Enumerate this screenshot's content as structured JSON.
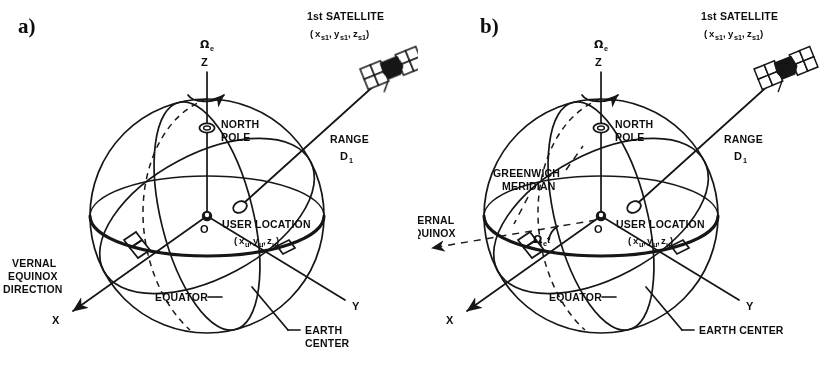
{
  "figure": {
    "domain": "diagram",
    "background_color": "#ffffff",
    "ink_color": "#141414",
    "width": 836,
    "height": 381
  },
  "panels": [
    {
      "id": "a",
      "tag": "a)",
      "satellite": {
        "title": "1st SATELLITE",
        "coords_open": "(",
        "coords": [
          {
            "base": "x",
            "sub": "s1"
          },
          {
            "base": "y",
            "sub": "s1"
          },
          {
            "base": "z",
            "sub": "s1"
          }
        ],
        "coords_close": ")",
        "icon": "satellite-icon"
      },
      "range": {
        "line1": "RANGE",
        "base": "D",
        "sub": "1"
      },
      "spin_axis": {
        "omega": "Ω",
        "omega_sub": "e",
        "axis": "Z"
      },
      "north_pole": {
        "line1": "NORTH",
        "line2": "POLE"
      },
      "user_location": {
        "title": "USER LOCATION",
        "coords_open": "(",
        "coords": [
          {
            "base": "x",
            "sub": "u"
          },
          {
            "base": "y",
            "sub": "u"
          },
          {
            "base": "z",
            "sub": "u"
          }
        ],
        "coords_close": ")"
      },
      "origin": "O",
      "equator": "EQUATOR",
      "earth_center": {
        "line1": "EARTH",
        "line2": "CENTER"
      },
      "vernal": {
        "line1": "VERNAL",
        "line2": "EQUINOX",
        "line3": "DIRECTION"
      },
      "axis_x": "X",
      "axis_y": "Y",
      "greenwich": null,
      "rotation_angle": null
    },
    {
      "id": "b",
      "tag": "b)",
      "satellite": {
        "title": "1st SATELLITE",
        "coords_open": "(",
        "coords": [
          {
            "base": "x",
            "sub": "s1"
          },
          {
            "base": "y",
            "sub": "s1"
          },
          {
            "base": "z",
            "sub": "s1"
          }
        ],
        "coords_close": ")",
        "icon": "satellite-icon"
      },
      "range": {
        "line1": "RANGE",
        "base": "D",
        "sub": "1"
      },
      "spin_axis": {
        "omega": "Ω",
        "omega_sub": "e",
        "axis": "Z"
      },
      "north_pole": {
        "line1": "NORTH",
        "line2": "POLE"
      },
      "user_location": {
        "title": "USER LOCATION",
        "coords_open": "(",
        "coords": [
          {
            "base": "x",
            "sub": "u"
          },
          {
            "base": "y",
            "sub": "u"
          },
          {
            "base": "z",
            "sub": "u"
          }
        ],
        "coords_close": ")"
      },
      "origin": "O",
      "equator": "EQUATOR",
      "earth_center": "EARTH CENTER",
      "vernal": {
        "line1": "VERNAL",
        "line2": "EQUINOX"
      },
      "axis_x": "X",
      "axis_y": "Y",
      "greenwich": {
        "line1": "GREENWICH",
        "line2": "MERIDIAN"
      },
      "rotation_angle": {
        "omega": "Ω",
        "omega_sub": "e",
        "time": "t"
      }
    }
  ]
}
